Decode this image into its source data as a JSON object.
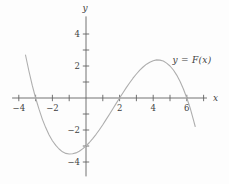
{
  "figure": {
    "background_color": "#fdfdfd",
    "axis_color": "#636363",
    "tick_text_color": "#3f3f3f",
    "curve_color": "#aeaeae"
  },
  "chart_data": {
    "type": "line",
    "title": "",
    "curve_label": "y = F(x)",
    "xlabel": "x",
    "ylabel": "y",
    "xlim": [
      -4.4,
      7.2
    ],
    "ylim": [
      -4.9,
      5.1
    ],
    "grid": false,
    "legend_position": "upper-right-annotation",
    "x_ticks": [
      {
        "v": -4,
        "label": "−4"
      },
      {
        "v": -3,
        "label": ""
      },
      {
        "v": -2,
        "label": "−2"
      },
      {
        "v": -1,
        "label": ""
      },
      {
        "v": 1,
        "label": ""
      },
      {
        "v": 2,
        "label": "2"
      },
      {
        "v": 3,
        "label": ""
      },
      {
        "v": 4,
        "label": "4"
      },
      {
        "v": 5,
        "label": ""
      },
      {
        "v": 6,
        "label": "6"
      },
      {
        "v": 7,
        "label": ""
      }
    ],
    "y_ticks": [
      {
        "v": -4,
        "label": "−4"
      },
      {
        "v": -3,
        "label": ""
      },
      {
        "v": -2,
        "label": "−2"
      },
      {
        "v": -1,
        "label": ""
      },
      {
        "v": 1,
        "label": ""
      },
      {
        "v": 2,
        "label": "2"
      },
      {
        "v": 3,
        "label": ""
      },
      {
        "v": 4,
        "label": "4"
      }
    ],
    "key_features": {
      "x_intercepts": [
        -3,
        2,
        6
      ],
      "y_intercept": -3,
      "local_min": {
        "x": -1,
        "y": -3.5
      },
      "local_max": {
        "x": 4.2,
        "y": 2.3
      }
    },
    "series": [
      {
        "name": "F",
        "points": [
          [
            -3.6,
            2.69
          ],
          [
            -3.4,
            1.69
          ],
          [
            -3.2,
            0.8
          ],
          [
            -3,
            0
          ],
          [
            -2.8,
            -0.7
          ],
          [
            -2.6,
            -1.32
          ],
          [
            -2.4,
            -1.85
          ],
          [
            -2.2,
            -2.3
          ],
          [
            -2,
            -2.67
          ],
          [
            -1.8,
            -2.96
          ],
          [
            -1.6,
            -3.19
          ],
          [
            -1.4,
            -3.36
          ],
          [
            -1.2,
            -3.46
          ],
          [
            -1,
            -3.5
          ],
          [
            -0.8,
            -3.49
          ],
          [
            -0.6,
            -3.43
          ],
          [
            -0.4,
            -3.33
          ],
          [
            -0.2,
            -3.18
          ],
          [
            0,
            -3
          ],
          [
            0.2,
            -2.78
          ],
          [
            0.4,
            -2.54
          ],
          [
            0.6,
            -2.27
          ],
          [
            0.8,
            -1.98
          ],
          [
            1,
            -1.67
          ],
          [
            1.2,
            -1.34
          ],
          [
            1.4,
            -1.01
          ],
          [
            1.6,
            -0.67
          ],
          [
            1.8,
            -0.34
          ],
          [
            2,
            0
          ],
          [
            2.2,
            0.33
          ],
          [
            2.4,
            0.65
          ],
          [
            2.6,
            0.95
          ],
          [
            2.8,
            1.24
          ],
          [
            3,
            1.5
          ],
          [
            3.2,
            1.74
          ],
          [
            3.4,
            1.94
          ],
          [
            3.6,
            2.11
          ],
          [
            3.8,
            2.24
          ],
          [
            4,
            2.33
          ],
          [
            4.2,
            2.38
          ],
          [
            4.4,
            2.37
          ],
          [
            4.6,
            2.31
          ],
          [
            4.8,
            2.18
          ],
          [
            5,
            2
          ],
          [
            5.2,
            1.75
          ],
          [
            5.4,
            1.43
          ],
          [
            5.6,
            1.03
          ],
          [
            5.8,
            0.56
          ],
          [
            6,
            0
          ],
          [
            6.2,
            -0.64
          ],
          [
            6.4,
            -1.38
          ],
          [
            6.5,
            -1.78
          ]
        ]
      }
    ]
  }
}
